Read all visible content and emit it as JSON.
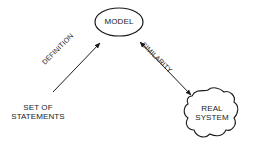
{
  "diagram": {
    "nodes": {
      "model": {
        "label": "MODEL",
        "shape": "ellipse"
      },
      "real_system": {
        "line1": "REAL",
        "line2": "SYSTEM",
        "shape": "cloud"
      },
      "statements": {
        "line1": "SET OF",
        "line2": "STATEMENTS",
        "shape": "text"
      }
    },
    "edges": {
      "definition": {
        "label": "DEFINITION",
        "from": "statements",
        "to": "model",
        "arrow": "single"
      },
      "similarity": {
        "label": "SIMILARITY",
        "from": "model",
        "to": "real_system",
        "arrow": "double"
      }
    },
    "colors": {
      "stroke": "#1a1a1a",
      "background": "#ffffff"
    }
  }
}
